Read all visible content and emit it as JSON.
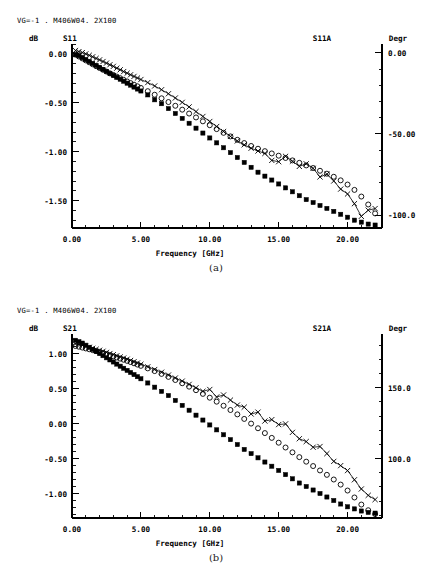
{
  "page": {
    "background": "#ffffff",
    "ink": "#000000"
  },
  "figures": [
    {
      "id": "figure-a",
      "caption": "(a)",
      "header": "VG=-1 . M406W04. 2X100",
      "left_unit": "dB",
      "left_series_label": "S11",
      "right_series_label": "S11A",
      "right_unit": "Degr",
      "xlabel": "Frequency [GHz]",
      "x_ticks": [
        "0.00",
        "5.00",
        "10.00",
        "15.00",
        "20.00"
      ],
      "y_left_ticks": [
        "0.00",
        "-0.50",
        "-1.00",
        "-1.50"
      ],
      "y_right_ticks": [
        "0.00",
        "-50.00",
        "-100.0"
      ]
    },
    {
      "id": "figure-b",
      "caption": "(b)",
      "header": "VG=-1 . M406W04. 2X100",
      "left_unit": "dB",
      "left_series_label": "S21",
      "right_series_label": "S21A",
      "right_unit": "Degr",
      "xlabel": "Frequency [GHz]",
      "x_ticks": [
        "0.00",
        "5.00",
        "10.00",
        "15.00",
        "20.00"
      ],
      "y_left_ticks": [
        "1.00",
        "0.50",
        "0.00",
        "-0.50",
        "-1.00"
      ],
      "y_right_ticks": [
        "150.0",
        "100.0"
      ]
    }
  ],
  "chart_data": [
    {
      "type": "scatter",
      "id": "chart-a",
      "title": "VG=-1 . M406W04. 2X100",
      "xlabel": "Frequency [GHz]",
      "ylabel": "dB",
      "y2label": "Degr",
      "xlim": [
        0,
        22.5
      ],
      "ylim": [
        -1.78,
        0.1
      ],
      "y2lim": [
        -108,
        5.5
      ],
      "grid": false,
      "legend": "none",
      "x_ticks": [
        0,
        5,
        10,
        15,
        20
      ],
      "x_minor_step": 1,
      "y_ticks": [
        0.0,
        -0.5,
        -1.0,
        -1.5
      ],
      "y_minor_step": 0.1,
      "y2_ticks": [
        0.0,
        -50.0,
        -100.0
      ],
      "y2_minor_step": 10,
      "series": [
        {
          "name": "S11 magnitude (dB)",
          "marker": "filled-square",
          "axis": "left",
          "x": [
            0.25,
            0.5,
            0.75,
            1.0,
            1.25,
            1.5,
            1.75,
            2.0,
            2.25,
            2.5,
            2.75,
            3.0,
            3.25,
            3.5,
            3.75,
            4.0,
            4.25,
            4.5,
            4.75,
            5.0,
            5.5,
            6.0,
            6.5,
            7.0,
            7.5,
            8.0,
            8.5,
            9.0,
            9.5,
            10.0,
            10.5,
            11.0,
            11.5,
            12.0,
            12.5,
            13.0,
            13.5,
            14.0,
            14.5,
            15.0,
            15.5,
            16.0,
            16.5,
            17.0,
            17.5,
            18.0,
            18.5,
            19.0,
            19.5,
            20.0,
            20.5,
            21.0,
            21.5,
            22.0
          ],
          "y": [
            -0.01,
            -0.02,
            -0.04,
            -0.06,
            -0.08,
            -0.1,
            -0.12,
            -0.14,
            -0.16,
            -0.18,
            -0.2,
            -0.22,
            -0.24,
            -0.26,
            -0.28,
            -0.3,
            -0.32,
            -0.34,
            -0.36,
            -0.38,
            -0.42,
            -0.47,
            -0.51,
            -0.56,
            -0.61,
            -0.66,
            -0.71,
            -0.76,
            -0.81,
            -0.86,
            -0.91,
            -0.96,
            -1.01,
            -1.06,
            -1.11,
            -1.16,
            -1.21,
            -1.25,
            -1.29,
            -1.33,
            -1.37,
            -1.41,
            -1.45,
            -1.49,
            -1.52,
            -1.55,
            -1.58,
            -1.61,
            -1.64,
            -1.67,
            -1.7,
            -1.72,
            -1.74,
            -1.75
          ]
        },
        {
          "name": "S11A phase (circle)",
          "marker": "circle",
          "axis": "right",
          "x": [
            0.25,
            0.5,
            0.75,
            1.0,
            1.25,
            1.5,
            1.75,
            2.0,
            2.25,
            2.5,
            2.75,
            3.0,
            3.25,
            3.5,
            3.75,
            4.0,
            4.25,
            4.5,
            4.75,
            5.0,
            5.5,
            6.0,
            6.5,
            7.0,
            7.5,
            8.0,
            8.5,
            9.0,
            9.5,
            10.0,
            10.5,
            11.0,
            11.5,
            12.0,
            12.5,
            13.0,
            13.5,
            14.0,
            14.5,
            15.0,
            15.5,
            16.0,
            16.5,
            17.0,
            17.5,
            18.0,
            18.5,
            19.0,
            19.5,
            20.0,
            20.5,
            21.0,
            21.5,
            22.0
          ],
          "y": [
            -1.0,
            -2.2,
            -3.4,
            -4.6,
            -5.8,
            -7.0,
            -8.2,
            -9.3,
            -10.4,
            -11.5,
            -12.6,
            -13.6,
            -14.6,
            -15.6,
            -16.6,
            -17.6,
            -18.6,
            -19.6,
            -20.6,
            -21.6,
            -23.6,
            -25.8,
            -28.0,
            -30.3,
            -32.6,
            -35.0,
            -37.4,
            -39.8,
            -42.2,
            -44.6,
            -47.0,
            -49.3,
            -51.5,
            -53.6,
            -55.6,
            -57.4,
            -59.1,
            -60.6,
            -62.0,
            -63.4,
            -64.8,
            -66.3,
            -67.8,
            -69.4,
            -71.0,
            -72.7,
            -74.5,
            -76.4,
            -78.6,
            -81.2,
            -84.5,
            -88.6,
            -93.5,
            -99.0
          ]
        },
        {
          "name": "S11A phase (cross)",
          "marker": "cross",
          "axis": "right",
          "x": [
            0.25,
            0.5,
            0.75,
            1.0,
            1.25,
            1.5,
            1.75,
            2.0,
            2.25,
            2.5,
            2.75,
            3.0,
            3.25,
            3.5,
            3.75,
            4.0,
            4.25,
            4.5,
            4.75,
            5.0,
            5.5,
            6.0,
            6.5,
            7.0,
            7.5,
            8.0,
            8.5,
            9.0,
            9.5,
            10.0,
            10.5,
            11.0,
            11.5,
            12.0,
            12.5,
            13.0,
            13.5,
            14.0,
            14.5,
            15.0,
            15.5,
            16.0,
            16.5,
            17.0,
            17.5,
            18.0,
            18.5,
            19.0,
            19.5,
            20.0,
            20.5,
            21.0,
            21.5,
            22.0
          ],
          "y": [
            1.5,
            0.8,
            0.2,
            -0.6,
            -1.5,
            -2.4,
            -3.4,
            -4.3,
            -5.3,
            -6.3,
            -7.3,
            -8.3,
            -9.4,
            -10.4,
            -11.5,
            -12.5,
            -13.5,
            -14.5,
            -15.5,
            -16.4,
            -18.3,
            -20.4,
            -22.7,
            -25.2,
            -27.8,
            -30.5,
            -33.3,
            -36.2,
            -39.2,
            -42.3,
            -45.4,
            -48.5,
            -51.5,
            -54.3,
            -56.7,
            -58.8,
            -60.5,
            -62.0,
            -66.3,
            -67.1,
            -63.8,
            -66.8,
            -70.0,
            -68.4,
            -71.2,
            -76.5,
            -74.8,
            -79.0,
            -84.0,
            -87.0,
            -93.0,
            -100.8,
            -97.0,
            -96.0
          ]
        }
      ]
    },
    {
      "type": "scatter",
      "id": "chart-b",
      "title": "VG=-1 . M406W04. 2X100",
      "xlabel": "Frequency [GHz]",
      "ylabel": "dB",
      "y2label": "Degr",
      "xlim": [
        0,
        22.5
      ],
      "ylim": [
        -1.35,
        1.28
      ],
      "y2lim": [
        58,
        188
      ],
      "grid": false,
      "legend": "none",
      "x_ticks": [
        0,
        5,
        10,
        15,
        20
      ],
      "x_minor_step": 1,
      "y_ticks": [
        1.0,
        0.5,
        0.0,
        -0.5,
        -1.0
      ],
      "y_minor_step": 0.1,
      "y2_ticks": [
        150.0,
        100.0
      ],
      "y2_minor_step": 10,
      "series": [
        {
          "name": "S21 magnitude (dB)",
          "marker": "filled-square",
          "axis": "left",
          "x": [
            0.25,
            0.5,
            0.75,
            1.0,
            1.25,
            1.5,
            1.75,
            2.0,
            2.25,
            2.5,
            2.75,
            3.0,
            3.25,
            3.5,
            3.75,
            4.0,
            4.25,
            4.5,
            4.75,
            5.0,
            5.5,
            6.0,
            6.5,
            7.0,
            7.5,
            8.0,
            8.5,
            9.0,
            9.5,
            10.0,
            10.5,
            11.0,
            11.5,
            12.0,
            12.5,
            13.0,
            13.5,
            14.0,
            14.5,
            15.0,
            15.5,
            16.0,
            16.5,
            17.0,
            17.5,
            18.0,
            18.5,
            19.0,
            19.5,
            20.0,
            20.5,
            21.0,
            21.5,
            22.0
          ],
          "y": [
            1.19,
            1.17,
            1.15,
            1.12,
            1.09,
            1.06,
            1.03,
            1.0,
            0.97,
            0.94,
            0.91,
            0.88,
            0.85,
            0.82,
            0.79,
            0.76,
            0.73,
            0.7,
            0.67,
            0.64,
            0.58,
            0.52,
            0.46,
            0.4,
            0.33,
            0.26,
            0.19,
            0.12,
            0.05,
            -0.02,
            -0.09,
            -0.16,
            -0.23,
            -0.3,
            -0.37,
            -0.43,
            -0.49,
            -0.55,
            -0.61,
            -0.67,
            -0.73,
            -0.79,
            -0.85,
            -0.9,
            -0.95,
            -1.0,
            -1.05,
            -1.1,
            -1.15,
            -1.19,
            -1.22,
            -1.25,
            -1.27,
            -1.28
          ]
        },
        {
          "name": "S21A phase (circle)",
          "marker": "circle",
          "axis": "right",
          "x": [
            0.25,
            0.5,
            0.75,
            1.0,
            1.25,
            1.5,
            1.75,
            2.0,
            2.25,
            2.5,
            2.75,
            3.0,
            3.25,
            3.5,
            3.75,
            4.0,
            4.25,
            4.5,
            4.75,
            5.0,
            5.5,
            6.0,
            6.5,
            7.0,
            7.5,
            8.0,
            8.5,
            9.0,
            9.5,
            10.0,
            10.5,
            11.0,
            11.5,
            12.0,
            12.5,
            13.0,
            13.5,
            14.0,
            14.5,
            15.0,
            15.5,
            16.0,
            16.5,
            17.0,
            17.5,
            18.0,
            18.5,
            19.0,
            19.5,
            20.0,
            20.5,
            21.0,
            21.5,
            22.0
          ],
          "y": [
            179.5,
            179.0,
            178.4,
            177.8,
            177.2,
            176.6,
            175.9,
            175.2,
            174.5,
            173.8,
            173.0,
            172.2,
            171.4,
            170.6,
            169.8,
            169.0,
            168.2,
            167.3,
            166.4,
            165.5,
            163.7,
            161.8,
            159.8,
            157.7,
            155.5,
            153.2,
            150.8,
            148.3,
            145.7,
            143.0,
            140.2,
            137.3,
            134.3,
            131.2,
            128.0,
            124.7,
            121.4,
            118.0,
            114.6,
            111.2,
            107.8,
            104.4,
            101.0,
            97.8,
            94.7,
            91.6,
            88.5,
            85.2,
            81.6,
            77.4,
            72.5,
            67.5,
            63.5,
            60.8
          ]
        },
        {
          "name": "S21A phase (cross)",
          "marker": "cross",
          "axis": "right",
          "x": [
            0.25,
            0.5,
            0.75,
            1.0,
            1.25,
            1.5,
            1.75,
            2.0,
            2.25,
            2.5,
            2.75,
            3.0,
            3.25,
            3.5,
            3.75,
            4.0,
            4.25,
            4.5,
            4.75,
            5.0,
            5.5,
            6.0,
            6.5,
            7.0,
            7.5,
            8.0,
            8.5,
            9.0,
            9.5,
            10.0,
            10.5,
            11.0,
            11.5,
            12.0,
            12.5,
            13.0,
            13.5,
            14.0,
            14.5,
            15.0,
            15.5,
            16.0,
            16.5,
            17.0,
            17.5,
            18.0,
            18.5,
            19.0,
            19.5,
            20.0,
            20.5,
            21.0,
            21.5,
            22.0
          ],
          "y": [
            181.0,
            180.5,
            180.0,
            179.3,
            178.6,
            177.9,
            177.2,
            176.5,
            175.8,
            175.0,
            174.2,
            173.4,
            172.6,
            171.8,
            171.0,
            170.2,
            169.3,
            168.4,
            167.5,
            166.6,
            164.8,
            162.9,
            161.0,
            159.0,
            156.9,
            154.7,
            152.4,
            150.0,
            147.5,
            148.8,
            143.5,
            144.9,
            141.3,
            137.8,
            136.3,
            131.5,
            132.8,
            126.5,
            127.5,
            124.0,
            124.5,
            118.5,
            114.0,
            112.0,
            108.0,
            108.5,
            103.5,
            98.0,
            95.0,
            91.5,
            85.0,
            78.5,
            74.0,
            71.0
          ]
        }
      ]
    }
  ]
}
